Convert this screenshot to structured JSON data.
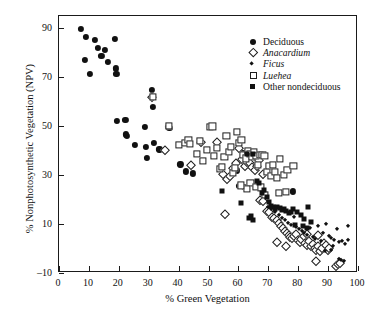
{
  "chart_data": {
    "type": "scatter",
    "title": "",
    "xlabel": "% Green Vegetation",
    "ylabel": "% Nonphotosynthetic Vegetation (NPV)",
    "xlim": [
      0,
      100
    ],
    "ylim": [
      -10,
      95
    ],
    "xticks": [
      0,
      10,
      20,
      30,
      40,
      50,
      60,
      70,
      80,
      90,
      100
    ],
    "yticks": [
      -10,
      10,
      30,
      50,
      70,
      90
    ],
    "grid": false,
    "legend_position": "top-right",
    "marker_color": "#111111",
    "series": [
      {
        "name": "Deciduous",
        "marker": "filled-circle",
        "points": [
          [
            7.3,
            89.7
          ],
          [
            9.0,
            86.3
          ],
          [
            10.4,
            71.5
          ],
          [
            8.6,
            77.0
          ],
          [
            11.9,
            85.3
          ],
          [
            13.1,
            82.0
          ],
          [
            14.2,
            78.8
          ],
          [
            15.4,
            81.2
          ],
          [
            16.4,
            76.1
          ],
          [
            18.6,
            85.5
          ],
          [
            18.9,
            73.6
          ],
          [
            19.2,
            71.3
          ],
          [
            19.4,
            52.2
          ],
          [
            22.2,
            52.6
          ],
          [
            22.5,
            46.6
          ],
          [
            22.8,
            46.1
          ],
          [
            25.5,
            42.2
          ],
          [
            28.8,
            49.6
          ],
          [
            29.0,
            41.4
          ],
          [
            29.3,
            37.0
          ],
          [
            31.0,
            64.8
          ],
          [
            31.5,
            57.7
          ],
          [
            31.8,
            43.2
          ],
          [
            33.6,
            40.5
          ],
          [
            36.3,
            49.6
          ],
          [
            36.9,
            49.2
          ],
          [
            40.6,
            34.4
          ],
          [
            42.5,
            31.5
          ],
          [
            44.8,
            30.7
          ],
          [
            59.5,
            31.9
          ],
          [
            61.5,
            39.0
          ],
          [
            62.5,
            39.2
          ],
          [
            63.4,
            38.6
          ],
          [
            64.3,
            39.0
          ],
          [
            60.3,
            25.5
          ],
          [
            61.8,
            25.2
          ],
          [
            78.2,
            23.3
          ]
        ]
      },
      {
        "name": "Anacardium",
        "marker": "open-diamond",
        "points": [
          [
            31.2,
            62.1
          ],
          [
            35.6,
            40.2
          ],
          [
            44.3,
            34.2
          ],
          [
            47.4,
            43.6
          ],
          [
            52.7,
            43.5
          ],
          [
            55.0,
            30.5
          ],
          [
            56.2,
            28.3
          ],
          [
            57.1,
            29.6
          ],
          [
            58.3,
            32.8
          ],
          [
            59.1,
            34.9
          ],
          [
            60.1,
            41.1
          ],
          [
            61.3,
            36.4
          ],
          [
            62.1,
            33.9
          ],
          [
            63.0,
            35.3
          ],
          [
            63.8,
            35.0
          ],
          [
            64.6,
            33.2
          ],
          [
            65.4,
            32.1
          ],
          [
            66.3,
            33.7
          ],
          [
            67.0,
            36.0
          ],
          [
            68.2,
            30.4
          ],
          [
            55.4,
            14.0
          ],
          [
            67.3,
            19.8
          ],
          [
            68.1,
            19.4
          ],
          [
            69.6,
            15.3
          ],
          [
            70.4,
            14.8
          ],
          [
            71.2,
            13.0
          ],
          [
            72.0,
            12.4
          ],
          [
            72.8,
            11.6
          ],
          [
            73.6,
            10.5
          ],
          [
            74.2,
            9.4
          ],
          [
            74.9,
            8.2
          ],
          [
            75.5,
            7.3
          ],
          [
            76.1,
            6.4
          ],
          [
            76.8,
            5.6
          ],
          [
            77.4,
            4.8
          ],
          [
            78.0,
            4.1
          ],
          [
            78.6,
            5.0
          ],
          [
            79.3,
            6.0
          ],
          [
            79.9,
            3.4
          ],
          [
            80.5,
            2.8
          ],
          [
            81.1,
            3.9
          ],
          [
            81.8,
            5.2
          ],
          [
            82.4,
            2.2
          ],
          [
            83.0,
            1.6
          ],
          [
            83.6,
            2.9
          ],
          [
            84.2,
            0.9
          ],
          [
            84.9,
            1.9
          ],
          [
            85.5,
            0.3
          ],
          [
            86.1,
            -0.4
          ],
          [
            86.7,
            1.1
          ],
          [
            87.3,
            -1.2
          ],
          [
            88.0,
            0.4
          ],
          [
            88.6,
            2.2
          ],
          [
            89.2,
            1.3
          ],
          [
            89.8,
            -0.8
          ],
          [
            90.4,
            0.1
          ],
          [
            85.9,
            -5.0
          ],
          [
            92.6,
            -7.2
          ],
          [
            93.2,
            -6.5
          ],
          [
            94.0,
            -5.8
          ],
          [
            73.0,
            2.5
          ],
          [
            75.8,
            1.2
          ],
          [
            82.8,
            6.0
          ],
          [
            86.5,
            5.4
          ]
        ]
      },
      {
        "name": "Ficus",
        "marker": "filled-diamond",
        "points": [
          [
            69.8,
            17.0
          ],
          [
            71.0,
            16.2
          ],
          [
            72.4,
            15.0
          ],
          [
            73.5,
            13.6
          ],
          [
            74.6,
            12.5
          ],
          [
            75.7,
            11.5
          ],
          [
            76.6,
            10.6
          ],
          [
            77.6,
            9.7
          ],
          [
            78.5,
            13.0
          ],
          [
            79.4,
            8.8
          ],
          [
            80.3,
            7.9
          ],
          [
            81.2,
            7.1
          ],
          [
            82.1,
            6.3
          ],
          [
            83.0,
            5.5
          ],
          [
            83.9,
            8.5
          ],
          [
            84.8,
            4.7
          ],
          [
            85.7,
            4.0
          ],
          [
            86.6,
            9.0
          ],
          [
            87.5,
            3.2
          ],
          [
            88.4,
            6.5
          ],
          [
            89.3,
            10.0
          ],
          [
            90.2,
            5.0
          ],
          [
            91.1,
            4.2
          ],
          [
            92.0,
            3.4
          ],
          [
            92.9,
            7.8
          ],
          [
            93.8,
            2.6
          ],
          [
            94.7,
            3.0
          ],
          [
            95.6,
            2.0
          ],
          [
            96.5,
            9.3
          ],
          [
            96.8,
            3.6
          ],
          [
            94.4,
            -4.8
          ],
          [
            95.3,
            -5.2
          ],
          [
            93.6,
            -4.4
          ],
          [
            90.9,
            -0.6
          ],
          [
            91.7,
            1.0
          ],
          [
            88.9,
            -1.0
          ]
        ]
      },
      {
        "name": "Luehea",
        "marker": "open-square",
        "points": [
          [
            31.4,
            61.8
          ],
          [
            36.8,
            50.0
          ],
          [
            40.2,
            42.5
          ],
          [
            42.0,
            43.0
          ],
          [
            43.3,
            44.4
          ],
          [
            43.8,
            42.8
          ],
          [
            46.0,
            38.6
          ],
          [
            47.0,
            44.0
          ],
          [
            48.2,
            35.8
          ],
          [
            49.4,
            40.2
          ],
          [
            50.6,
            49.6
          ],
          [
            51.3,
            49.9
          ],
          [
            51.9,
            38.0
          ],
          [
            52.8,
            41.0
          ],
          [
            53.7,
            32.5
          ],
          [
            54.5,
            33.2
          ],
          [
            55.3,
            37.5
          ],
          [
            56.0,
            46.0
          ],
          [
            56.8,
            39.5
          ],
          [
            57.5,
            41.5
          ],
          [
            58.2,
            31.0
          ],
          [
            58.9,
            33.0
          ],
          [
            59.6,
            47.5
          ],
          [
            60.3,
            43.2
          ],
          [
            61.0,
            44.5
          ],
          [
            61.7,
            38.2
          ],
          [
            62.4,
            36.8
          ],
          [
            63.1,
            40.0
          ],
          [
            63.8,
            38.5
          ],
          [
            64.5,
            37.5
          ],
          [
            65.2,
            39.3
          ],
          [
            65.9,
            38.0
          ],
          [
            66.6,
            34.2
          ],
          [
            67.3,
            38.4
          ],
          [
            68.0,
            38.2
          ],
          [
            68.7,
            37.8
          ],
          [
            69.4,
            31.2
          ],
          [
            70.1,
            33.6
          ],
          [
            70.8,
            29.8
          ],
          [
            71.5,
            34.0
          ],
          [
            72.2,
            31.4
          ],
          [
            73.0,
            29.0
          ],
          [
            74.0,
            36.5
          ],
          [
            75.2,
            30.2
          ],
          [
            76.4,
            32.0
          ],
          [
            78.4,
            33.8
          ],
          [
            64.0,
            26.8
          ],
          [
            66.0,
            25.2
          ],
          [
            67.6,
            25.0
          ],
          [
            69.0,
            22.0
          ],
          [
            62.8,
            24.5
          ],
          [
            60.8,
            25.8
          ],
          [
            73.6,
            22.8
          ],
          [
            76.0,
            23.2
          ]
        ]
      },
      {
        "name": "Other nondeciduous",
        "marker": "filled-square",
        "points": [
          [
            54.4,
            23.3
          ],
          [
            63.0,
            38.8
          ],
          [
            64.8,
            38.6
          ],
          [
            66.2,
            27.5
          ],
          [
            66.9,
            26.6
          ],
          [
            67.8,
            22.8
          ],
          [
            68.6,
            24.0
          ],
          [
            69.4,
            21.0
          ],
          [
            70.2,
            19.0
          ],
          [
            70.9,
            17.5
          ],
          [
            71.6,
            16.8
          ],
          [
            72.3,
            16.2
          ],
          [
            73.0,
            17.0
          ],
          [
            73.8,
            16.5
          ],
          [
            74.5,
            15.8
          ],
          [
            75.3,
            16.0
          ],
          [
            76.0,
            15.2
          ],
          [
            76.8,
            14.6
          ],
          [
            77.6,
            15.0
          ],
          [
            78.4,
            16.1
          ],
          [
            79.6,
            14.8
          ],
          [
            80.8,
            13.5
          ],
          [
            82.0,
            12.0
          ],
          [
            83.2,
            16.8
          ],
          [
            84.4,
            11.0
          ],
          [
            79.0,
            9.8
          ],
          [
            81.6,
            9.0
          ],
          [
            82.8,
            8.2
          ],
          [
            61.0,
            18.5
          ],
          [
            63.6,
            12.5
          ],
          [
            65.0,
            11.8
          ],
          [
            64.2,
            13.2
          ]
        ]
      }
    ]
  },
  "legend": {
    "items": [
      {
        "label": "Deciduous",
        "marker": "filled-circle",
        "italic": false
      },
      {
        "label": "Anacardium",
        "marker": "open-diamond",
        "italic": true
      },
      {
        "label": "Ficus",
        "marker": "filled-diamond",
        "italic": true
      },
      {
        "label": "Luehea",
        "marker": "open-square",
        "italic": true
      },
      {
        "label": "Other nondeciduous",
        "marker": "filled-square",
        "italic": false
      }
    ]
  }
}
